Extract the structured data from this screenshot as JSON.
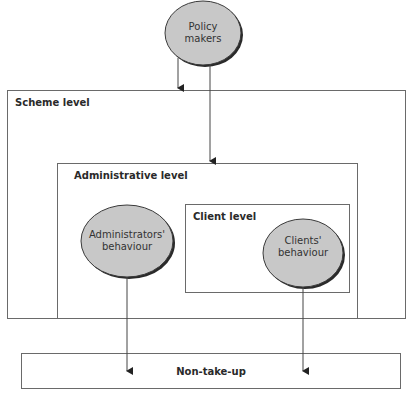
{
  "diagram": {
    "nodes": {
      "policy_makers": {
        "label_line1": "Policy",
        "label_line2": "makers"
      },
      "administrators_behaviour": {
        "label_line1": "Administrators'",
        "label_line2": "behaviour"
      },
      "clients_behaviour": {
        "label_line1": "Clients'",
        "label_line2": "behaviour"
      }
    },
    "containers": {
      "scheme_level": {
        "label": "Scheme level"
      },
      "administrative_level": {
        "label": "Administrative level"
      },
      "client_level": {
        "label": "Client level"
      }
    },
    "outcome": {
      "label": "Non-take-up"
    },
    "edges": [
      {
        "from": "Policy makers",
        "to": "Scheme level"
      },
      {
        "from": "Policy makers",
        "to": "Administrative level"
      },
      {
        "from": "Administrators' behaviour",
        "to": "Non-take-up"
      },
      {
        "from": "Clients' behaviour",
        "to": "Non-take-up"
      }
    ],
    "colors": {
      "ellipse_fill": "#c8c8c8",
      "ellipse_stroke": "#3a3a3a",
      "line": "#444444",
      "box_border": "#6a6a6a"
    }
  }
}
